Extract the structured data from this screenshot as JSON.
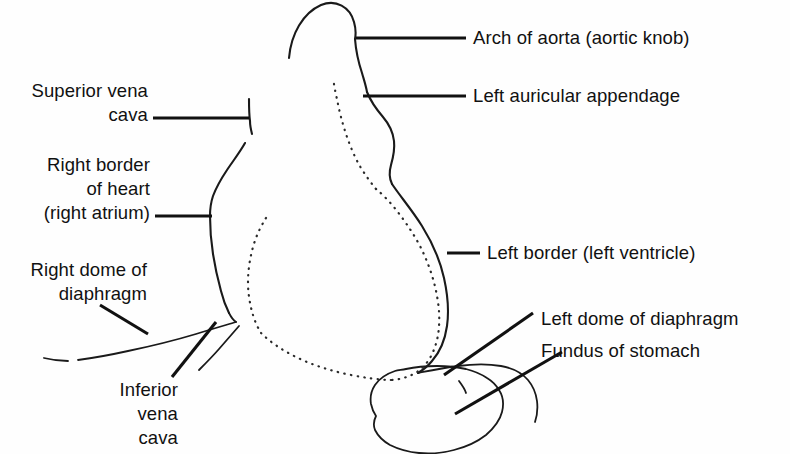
{
  "figure": {
    "background_color": "#fefefe",
    "ink_color": "#1a1a1a"
  },
  "labels": {
    "arch_of_aorta": "Arch of aorta (aortic knob)",
    "left_auricular_appendage": "Left auricular appendage",
    "left_border": "Left border (left ventricle)",
    "left_dome_of_diaphragm": "Left dome of diaphragm",
    "fundus_of_stomach": "Fundus of stomach",
    "superior_vena_cava": "Superior vena\ncava",
    "right_border_of_heart": "Right border\nof heart\n(right atrium)",
    "right_dome_of_diaphragm": "Right dome of\ndiaphragm",
    "inferior_vena_cava": "Inferior\nvena\ncava"
  },
  "structures": [
    {
      "name": "aortic-knob",
      "style": "solid"
    },
    {
      "name": "left-auricular-appendage",
      "style": "solid"
    },
    {
      "name": "left-ventricular-border",
      "style": "solid"
    },
    {
      "name": "right-atrial-border",
      "style": "solid"
    },
    {
      "name": "superior-vena-cava-border",
      "style": "solid"
    },
    {
      "name": "right-hemidiaphragm",
      "style": "solid"
    },
    {
      "name": "inferior-vena-cava-shadow",
      "style": "solid"
    },
    {
      "name": "left-hemidiaphragm",
      "style": "solid"
    },
    {
      "name": "gastric-bubble",
      "style": "solid"
    },
    {
      "name": "inner-cardiac-contour",
      "style": "dotted"
    }
  ]
}
